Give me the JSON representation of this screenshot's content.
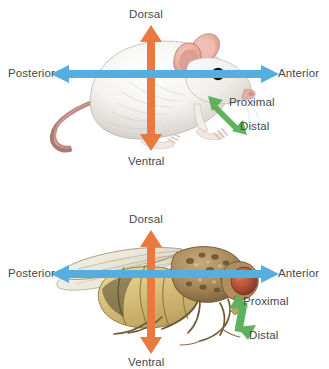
{
  "figure": {
    "background_color": "#ffffff",
    "width": 329,
    "height": 369
  },
  "colors": {
    "dorsal_ventral_arrow": "#E8793F",
    "anterior_posterior_arrow": "#55ADE0",
    "proximal_distal_arrow": "#5FB25C",
    "label_text": "#3d4b52",
    "background": "#ffffff"
  },
  "panels": [
    {
      "id": "mouse",
      "organism": "mouse",
      "organism_icon": "mouse-illustration",
      "labels": {
        "dorsal": "Dorsal",
        "ventral": "Ventral",
        "anterior": "Anterior",
        "posterior": "Posterior",
        "proximal": "Proximal",
        "distal": "Distal"
      }
    },
    {
      "id": "fly",
      "organism": "fly",
      "organism_icon": "fruit-fly-illustration",
      "labels": {
        "dorsal": "Dorsal",
        "ventral": "Ventral",
        "anterior": "Anterior",
        "posterior": "Posterior",
        "proximal": "Proximal",
        "distal": "Distal"
      }
    }
  ]
}
